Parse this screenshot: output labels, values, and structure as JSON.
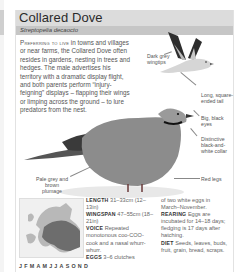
{
  "page": {
    "title": "Collared Dove",
    "subtitle": "Streptopelia decaocto",
    "intro_lead": "Preferring to live",
    "intro_rest": " in towns and villages or near farms, the Collared Dove often resides in gardens, nesting in trees and hedges. The male advertises his territory with a dramatic display flight, and both parents perform “injury-feigning” displays – flapping their wings or limping across the ground – to lure predators from the nest."
  },
  "labels": {
    "wingtips": "Dark grey wingtips",
    "tail": "Long, square-ended tail",
    "eyes": "Big, black eyes",
    "collar": "Distinctive black-and-white collar",
    "plumage": "Pale grey and brown plumage",
    "legs": "Red legs"
  },
  "facts": {
    "length_label": "LENGTH",
    "length_value": " 31–33cm (12–13in)",
    "wingspan_label": "WINGSPAN",
    "wingspan_value": " 47–55cm (18–21in)",
    "voice_label": "VOICE",
    "voice_value": " Repeated monotonous coo-COO-cook and a nasal whurr-whurr.",
    "eggs_label": "EGGS",
    "eggs_value": " 3–6 clutches of two white eggs in March–November.",
    "rearing_label": "REARING",
    "rearing_value": " Eggs are incubated for 14–18 days; fledging is 17 days after hatching.",
    "diet_label": "DIET",
    "diet_value": " Seeds, leaves, buds, fruit, grain, bread, scraps."
  },
  "months": "JFMAMJJASOND",
  "icons": {
    "flying_bird": "flying-dove-illustration",
    "perched_bird": "perched-dove-illustration",
    "map": "europe-range-map"
  },
  "colors": {
    "title_band": "#dcdcdc",
    "subtitle_band": "#c6c6c6",
    "range_fill": "#6d6d6d"
  }
}
